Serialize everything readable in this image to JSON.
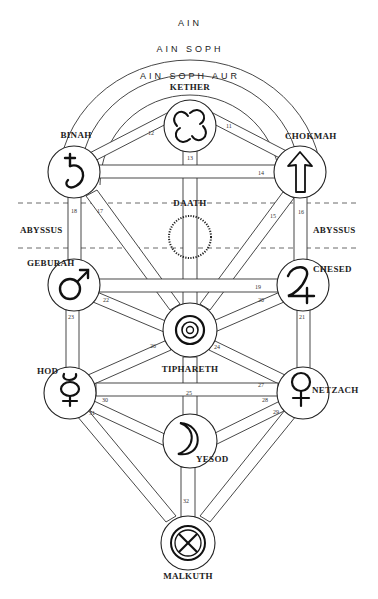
{
  "veils": [
    {
      "label": "AIN"
    },
    {
      "label": "AIN SOPH"
    },
    {
      "label": "AIN SOPH AUR"
    }
  ],
  "abyss": {
    "left_label": "ABYSSUS",
    "right_label": "ABYSSUS"
  },
  "sephiroth": {
    "kether": {
      "label": "KETHER",
      "symbol": "swirl-icon"
    },
    "chokmah": {
      "label": "CHOKMAH",
      "symbol": "arrow-up-icon"
    },
    "binah": {
      "label": "BINAH",
      "symbol": "saturn-icon"
    },
    "daath": {
      "label": "DAATH",
      "symbol": "ring-icon"
    },
    "chesed": {
      "label": "CHESED",
      "symbol": "jupiter-icon"
    },
    "geburah": {
      "label": "GEBURAH",
      "symbol": "mars-icon"
    },
    "tiphareth": {
      "label": "TIPHARETH",
      "symbol": "sun-icon"
    },
    "netzach": {
      "label": "NETZACH",
      "symbol": "venus-icon"
    },
    "hod": {
      "label": "HOD",
      "symbol": "mercury-icon"
    },
    "yesod": {
      "label": "YESOD",
      "symbol": "moon-icon"
    },
    "malkuth": {
      "label": "MALKUTH",
      "symbol": "earth-icon"
    }
  },
  "paths": [
    {
      "number": "11",
      "from": "kether",
      "to": "chokmah"
    },
    {
      "number": "12",
      "from": "kether",
      "to": "binah"
    },
    {
      "number": "13",
      "from": "kether",
      "to": "tiphareth"
    },
    {
      "number": "14",
      "from": "chokmah",
      "to": "binah"
    },
    {
      "number": "15",
      "from": "chokmah",
      "to": "tiphareth"
    },
    {
      "number": "16",
      "from": "chokmah",
      "to": "chesed"
    },
    {
      "number": "17",
      "from": "binah",
      "to": "tiphareth"
    },
    {
      "number": "18",
      "from": "binah",
      "to": "geburah"
    },
    {
      "number": "19",
      "from": "chesed",
      "to": "geburah"
    },
    {
      "number": "20",
      "from": "chesed",
      "to": "tiphareth"
    },
    {
      "number": "21",
      "from": "chesed",
      "to": "netzach"
    },
    {
      "number": "22",
      "from": "geburah",
      "to": "tiphareth"
    },
    {
      "number": "23",
      "from": "geburah",
      "to": "hod"
    },
    {
      "number": "24",
      "from": "tiphareth",
      "to": "netzach"
    },
    {
      "number": "25",
      "from": "tiphareth",
      "to": "yesod"
    },
    {
      "number": "26",
      "from": "tiphareth",
      "to": "hod"
    },
    {
      "number": "27",
      "from": "netzach",
      "to": "hod"
    },
    {
      "number": "28",
      "from": "netzach",
      "to": "yesod"
    },
    {
      "number": "29",
      "from": "netzach",
      "to": "malkuth"
    },
    {
      "number": "30",
      "from": "hod",
      "to": "yesod"
    },
    {
      "number": "31",
      "from": "hod",
      "to": "malkuth"
    },
    {
      "number": "32",
      "from": "yesod",
      "to": "malkuth"
    }
  ]
}
